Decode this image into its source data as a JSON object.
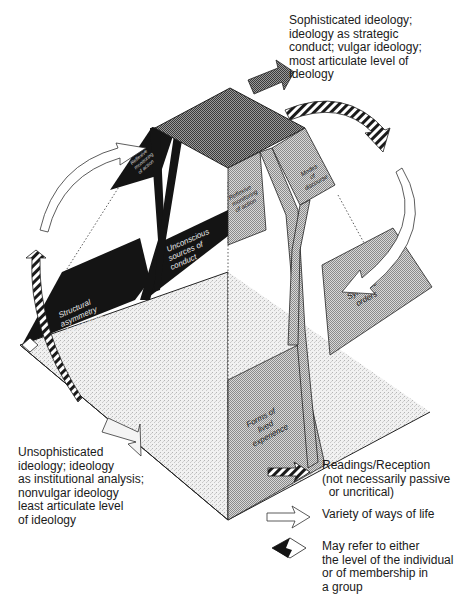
{
  "captions": {
    "top": {
      "lines": [
        "Sophisticated ideology;",
        "ideology as strategic",
        "conduct; vulgar ideology;",
        "most articulate level of",
        "ideology"
      ]
    },
    "bottom": {
      "lines": [
        "Unsophisticated",
        "ideology; ideology",
        "as institutional analysis;",
        "nonvulgar ideology",
        "least articulate level",
        "of ideology"
      ]
    }
  },
  "panels": {
    "reflexive_back": {
      "lines": [
        "Reflexive",
        "monitoring",
        "of action"
      ]
    },
    "unconscious": {
      "lines": [
        "Unconscious",
        "sources of",
        "conduct"
      ]
    },
    "structural": {
      "lines": [
        "Structural",
        "asymmetry",
        "of resources"
      ]
    },
    "reflexive_front": {
      "lines": [
        "Reflexive",
        "monitoring",
        "of action"
      ]
    },
    "modes": {
      "lines": [
        "Modes",
        "of",
        "discourse"
      ]
    },
    "symbolic": {
      "lines": [
        "Symbolic",
        "orders"
      ]
    },
    "forms": {
      "lines": [
        "Forms of",
        "lived",
        "experience"
      ]
    }
  },
  "legend": {
    "items": [
      {
        "icon": "striped-arrow-icon",
        "lines": [
          "Readings/Reception",
          "(not necessarily passive",
          "  or uncritical)"
        ]
      },
      {
        "icon": "hollow-arrow-icon",
        "lines": [
          "Variety of ways of life"
        ]
      },
      {
        "icon": "split-diamond-icon",
        "lines": [
          "May refer to either",
          "the level of the individual",
          "or of membership in",
          "a group"
        ]
      }
    ]
  },
  "colors": {
    "black_panel": "#141414",
    "top_face": "#7a7a7a",
    "light_panel": "#c9c9c9",
    "stipple_base": "#ececec",
    "outline": "#222222"
  }
}
